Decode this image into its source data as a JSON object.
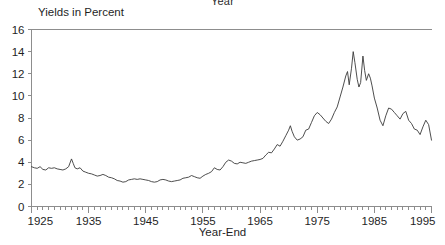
{
  "figure": {
    "top_title": "Year",
    "ylabel": "Yields in Percent",
    "xlabel": "Year-End"
  },
  "chart_data": {
    "type": "line",
    "title": "Year",
    "xlabel": "Year-End",
    "ylabel": "Yields in Percent",
    "xlim": [
      1925,
      1995
    ],
    "ylim": [
      0,
      16
    ],
    "ytick_step": 2,
    "xtick_step": 10,
    "xminor_step": 1,
    "grid": false,
    "legend": null,
    "line_color": "#3a3a3a",
    "axis_color": "#8d8d8d",
    "background": "#ffffff",
    "ytick_labels": [
      "0",
      "2",
      "4",
      "6",
      "8",
      "10",
      "12",
      "14",
      "16"
    ],
    "xtick_labels": [
      "1925",
      "1935",
      "1945",
      "1955",
      "1965",
      "1975",
      "1985",
      "1995"
    ],
    "series": [
      {
        "name": "Yields",
        "x": [
          1925.0,
          1925.5,
          1926.0,
          1926.5,
          1927.0,
          1927.5,
          1928.0,
          1928.5,
          1929.0,
          1929.5,
          1930.0,
          1930.5,
          1931.0,
          1931.5,
          1932.0,
          1932.3,
          1932.6,
          1933.0,
          1933.5,
          1934.0,
          1934.5,
          1935.0,
          1935.5,
          1936.0,
          1936.5,
          1937.0,
          1937.5,
          1938.0,
          1938.5,
          1939.0,
          1939.5,
          1940.0,
          1940.5,
          1941.0,
          1941.5,
          1942.0,
          1942.5,
          1943.0,
          1943.5,
          1944.0,
          1944.5,
          1945.0,
          1945.5,
          1946.0,
          1946.5,
          1947.0,
          1947.5,
          1948.0,
          1948.5,
          1949.0,
          1949.5,
          1950.0,
          1950.5,
          1951.0,
          1951.5,
          1952.0,
          1952.5,
          1953.0,
          1953.5,
          1954.0,
          1954.5,
          1955.0,
          1955.5,
          1956.0,
          1956.5,
          1957.0,
          1957.5,
          1958.0,
          1958.5,
          1959.0,
          1959.5,
          1960.0,
          1960.5,
          1961.0,
          1961.5,
          1962.0,
          1962.5,
          1963.0,
          1963.5,
          1964.0,
          1964.5,
          1965.0,
          1965.5,
          1966.0,
          1966.5,
          1967.0,
          1967.5,
          1968.0,
          1968.5,
          1969.0,
          1969.5,
          1970.0,
          1970.3,
          1970.6,
          1971.0,
          1971.5,
          1972.0,
          1972.5,
          1973.0,
          1973.5,
          1974.0,
          1974.5,
          1975.0,
          1975.5,
          1976.0,
          1976.5,
          1977.0,
          1977.5,
          1978.0,
          1978.5,
          1979.0,
          1979.5,
          1980.0,
          1980.3,
          1980.6,
          1981.0,
          1981.3,
          1981.6,
          1982.0,
          1982.3,
          1982.6,
          1983.0,
          1983.3,
          1983.6,
          1984.0,
          1984.3,
          1984.6,
          1985.0,
          1985.5,
          1986.0,
          1986.5,
          1987.0,
          1987.5,
          1988.0,
          1988.5,
          1989.0,
          1989.5,
          1990.0,
          1990.5,
          1991.0,
          1991.5,
          1992.0,
          1992.5,
          1993.0,
          1993.5,
          1994.0,
          1994.5,
          1995.0
        ],
        "y": [
          3.6,
          3.5,
          3.45,
          3.6,
          3.35,
          3.3,
          3.5,
          3.45,
          3.5,
          3.4,
          3.35,
          3.3,
          3.4,
          3.6,
          4.3,
          3.9,
          3.5,
          3.4,
          3.5,
          3.2,
          3.1,
          3.0,
          2.95,
          2.85,
          2.75,
          2.8,
          2.9,
          2.8,
          2.65,
          2.6,
          2.5,
          2.35,
          2.3,
          2.2,
          2.25,
          2.4,
          2.45,
          2.5,
          2.45,
          2.5,
          2.45,
          2.4,
          2.35,
          2.25,
          2.2,
          2.25,
          2.4,
          2.45,
          2.4,
          2.3,
          2.25,
          2.3,
          2.35,
          2.4,
          2.55,
          2.6,
          2.65,
          2.8,
          2.7,
          2.6,
          2.55,
          2.75,
          2.9,
          3.0,
          3.15,
          3.5,
          3.35,
          3.3,
          3.6,
          4.0,
          4.2,
          4.1,
          3.9,
          3.85,
          4.0,
          3.95,
          3.9,
          4.0,
          4.1,
          4.15,
          4.2,
          4.25,
          4.35,
          4.65,
          4.9,
          4.85,
          5.2,
          5.6,
          5.45,
          5.9,
          6.4,
          6.9,
          7.3,
          6.8,
          6.3,
          6.0,
          6.1,
          6.3,
          6.9,
          7.0,
          7.6,
          8.2,
          8.5,
          8.3,
          8.0,
          7.7,
          7.5,
          7.9,
          8.5,
          9.0,
          9.9,
          10.8,
          11.8,
          12.2,
          11.0,
          12.5,
          14.0,
          13.0,
          11.5,
          10.8,
          11.2,
          13.6,
          12.3,
          11.4,
          12.0,
          11.6,
          10.9,
          9.8,
          8.9,
          7.8,
          7.3,
          8.2,
          8.9,
          8.8,
          8.5,
          8.2,
          7.9,
          8.4,
          8.6,
          7.8,
          7.5,
          7.0,
          6.9,
          6.5,
          7.2,
          7.8,
          7.4,
          6.0
        ]
      }
    ]
  }
}
